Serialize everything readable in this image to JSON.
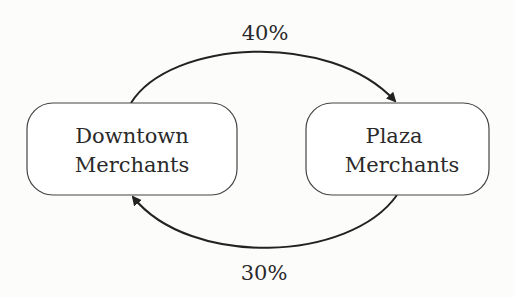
{
  "diagram": {
    "nodes": [
      {
        "id": "downtown",
        "line1": "Downtown",
        "line2": "Merchants"
      },
      {
        "id": "plaza",
        "line1": "Plaza",
        "line2": "Merchants"
      }
    ],
    "edges": [
      {
        "from": "downtown",
        "to": "plaza",
        "label": "40%"
      },
      {
        "from": "plaza",
        "to": "downtown",
        "label": "30%"
      }
    ]
  }
}
